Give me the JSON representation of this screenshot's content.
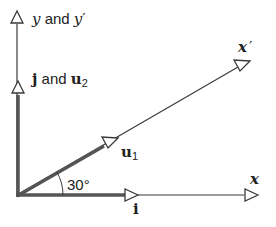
{
  "diagram": {
    "type": "rotated-coordinate-axes",
    "angle_label": "30°",
    "colors": {
      "background": "#ffffff",
      "axis_line": "#3a3a3a",
      "vector_line": "#555555",
      "text": "#222222"
    },
    "axes": {
      "y": {
        "var": "y",
        "connector": " and ",
        "var2": "y",
        "prime": "′"
      },
      "x_prime": {
        "var": "x",
        "prime": "′"
      },
      "x": {
        "var": "x"
      }
    },
    "vectors": {
      "j_u2": {
        "bold1": "j",
        "connector": " and ",
        "bold2": "u",
        "sub": "2"
      },
      "u1": {
        "bold": "u",
        "sub": "1"
      },
      "i": {
        "bold": "i"
      }
    }
  }
}
